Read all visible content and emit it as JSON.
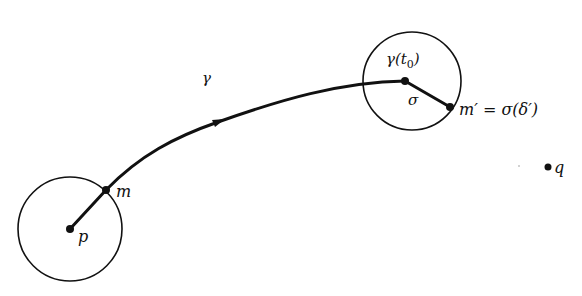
{
  "diagram": {
    "type": "curve-through-neighborhoods",
    "colors": {
      "ink": "#111111",
      "background": "#ffffff"
    },
    "nodes": [
      {
        "id": "p",
        "label": "p",
        "x": 70,
        "y": 229
      },
      {
        "id": "m",
        "label": "m",
        "x": 106,
        "y": 190
      },
      {
        "id": "gamma_t0",
        "label": "γ(t₀)",
        "x": 405,
        "y": 81
      },
      {
        "id": "m_prime",
        "label": "m′ = σ(δ′)",
        "x": 450,
        "y": 107
      },
      {
        "id": "q",
        "label": "q",
        "x": 548,
        "y": 167
      }
    ],
    "circles": [
      {
        "id": "neighborhood-p",
        "cx": 70,
        "cy": 229,
        "r": 52
      },
      {
        "id": "neighborhood-gamma-t0",
        "cx": 412,
        "cy": 81,
        "r": 49
      }
    ],
    "edges": [
      {
        "id": "segment-p-m",
        "from": "p",
        "to": "m"
      },
      {
        "id": "curve-gamma",
        "from": "m",
        "to": "gamma_t0",
        "label": "γ",
        "arrow": true
      },
      {
        "id": "segment-sigma",
        "from": "gamma_t0",
        "to": "m_prime",
        "label": "σ"
      }
    ]
  },
  "labels": {
    "p": "p",
    "m": "m",
    "gamma": "γ",
    "gamma_t0_prefix": "γ(t",
    "gamma_t0_sub": "0",
    "gamma_t0_suffix": ")",
    "sigma": "σ",
    "m_prime_eq": "m′ = σ(δ′)",
    "q": "q"
  }
}
